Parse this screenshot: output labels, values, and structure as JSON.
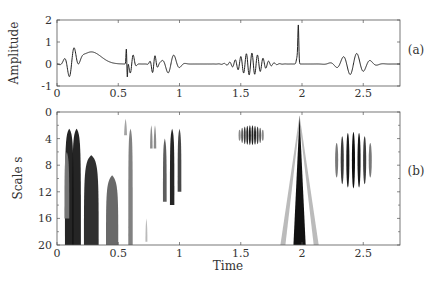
{
  "chart_data": [
    {
      "id": "a",
      "type": "line",
      "panel_label": "(a)",
      "title": "",
      "xlabel": "",
      "ylabel": "Amplitude",
      "xlim": [
        0,
        2.8
      ],
      "ylim": [
        -1,
        2
      ],
      "xticks": [
        0,
        0.5,
        1,
        1.5,
        2,
        2.5
      ],
      "xtick_labels": [
        "0",
        "0.5",
        "1",
        "1.5",
        "2",
        "2.5"
      ],
      "yticks": [
        2,
        1,
        0,
        -1
      ],
      "ytick_labels": [
        "2",
        "1",
        "0",
        "-1"
      ],
      "grid": false,
      "components": [
        {
          "kind": "wavelet",
          "center": 0.12,
          "width": 0.04,
          "freq": 12,
          "amp": 0.7
        },
        {
          "kind": "bump",
          "center": 0.28,
          "width": 0.08,
          "amp": 0.55
        },
        {
          "kind": "spike_pair",
          "center": 0.57,
          "amp": 0.65
        },
        {
          "kind": "wavelet",
          "center": 0.61,
          "width": 0.02,
          "freq": 18,
          "amp": 0.5
        },
        {
          "kind": "wavelet",
          "center": 0.79,
          "width": 0.02,
          "freq": 22,
          "amp": 0.45
        },
        {
          "kind": "wavelet",
          "center": 0.93,
          "width": 0.05,
          "freq": 10,
          "amp": 0.45
        },
        {
          "kind": "wavelet",
          "center": 1.58,
          "width": 0.09,
          "freq": 22,
          "amp": 0.5
        },
        {
          "kind": "spike",
          "center": 1.97,
          "amp": 1.7
        },
        {
          "kind": "wavelet",
          "center": 2.42,
          "width": 0.09,
          "freq": 9,
          "amp": 0.5
        }
      ]
    },
    {
      "id": "b",
      "type": "heatmap",
      "panel_label": "(b)",
      "title": "",
      "xlabel": "Time",
      "ylabel": "Scale s",
      "xlim": [
        0,
        2.8
      ],
      "ylim": [
        20,
        0
      ],
      "xticks": [
        0,
        0.5,
        1,
        1.5,
        2,
        2.5
      ],
      "xtick_labels": [
        "0",
        "0.5",
        "1",
        "1.5",
        "2",
        "2.5"
      ],
      "yticks": [
        0,
        4,
        8,
        12,
        16,
        20
      ],
      "ytick_labels": [
        "0",
        "4",
        "8",
        "12",
        "16",
        "20"
      ],
      "colormap": "gray_r",
      "features": [
        {
          "t": 0.1,
          "s0": 2.5,
          "s1": 20,
          "w": 0.035,
          "dark": 0.95
        },
        {
          "t": 0.16,
          "s0": 2.5,
          "s1": 20,
          "w": 0.035,
          "dark": 0.95
        },
        {
          "t": 0.08,
          "s0": 6,
          "s1": 16,
          "w": 0.02,
          "dark": 0.5
        },
        {
          "t": 0.28,
          "s0": 6.5,
          "s1": 20,
          "w": 0.06,
          "dark": 0.9
        },
        {
          "t": 0.45,
          "s0": 9.5,
          "s1": 20,
          "w": 0.05,
          "dark": 0.65
        },
        {
          "t": 0.56,
          "s0": 1,
          "s1": 3.5,
          "w": 0.012,
          "dark": 0.4
        },
        {
          "t": 0.6,
          "s0": 2.5,
          "s1": 20,
          "w": 0.018,
          "dark": 0.55
        },
        {
          "t": 0.73,
          "s0": 16,
          "s1": 19.5,
          "w": 0.008,
          "dark": 0.3
        },
        {
          "t": 0.77,
          "s0": 2,
          "s1": 5.5,
          "w": 0.01,
          "dark": 0.5
        },
        {
          "t": 0.8,
          "s0": 2,
          "s1": 5.5,
          "w": 0.01,
          "dark": 0.5
        },
        {
          "t": 0.88,
          "s0": 4,
          "s1": 13.5,
          "w": 0.015,
          "dark": 0.7
        },
        {
          "t": 0.94,
          "s0": 2.5,
          "s1": 14,
          "w": 0.018,
          "dark": 0.95
        },
        {
          "t": 1.0,
          "s0": 2.5,
          "s1": 12,
          "w": 0.015,
          "dark": 0.8
        }
      ],
      "oscillation_patches": [
        {
          "t0": 1.48,
          "t1": 1.69,
          "s0": 2,
          "s1": 5,
          "stripes": 10,
          "dark": 0.9
        },
        {
          "t0": 2.26,
          "t1": 2.58,
          "s0": 3,
          "s1": 11.5,
          "stripes": 7,
          "dark": 0.95
        }
      ],
      "cone": {
        "t": 1.98,
        "apex": 0.5,
        "half_width_at_20": 0.05,
        "side_lines_at_20": [
          1.84,
          2.12
        ]
      }
    }
  ]
}
